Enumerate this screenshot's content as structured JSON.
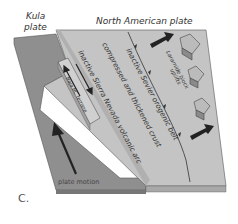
{
  "diagram": {
    "panel_label": "C.",
    "kula_plate_label_line1": "Kula",
    "kula_plate_label_line2": "plate",
    "north_american_plate_label": "North American plate",
    "baja_terrane_label": "Baja BC terrane",
    "sierra_arc_label": "inactive Sierra Nevada volcanic arc",
    "crust_label": "compressed and thickened crust",
    "sevier_label": "inactive Sevier orogenic belt",
    "laramide_label_line1": "Laramide block",
    "laramide_label_line2": "uplifts",
    "plate_motion_label": "plate motion",
    "colors": {
      "kula_plate": "#8f8f8f",
      "north_american_plate": "#c4c4c4",
      "plate_edge": "#a8a8a8",
      "arrow": "#222222",
      "block": "#9a9a9a"
    }
  }
}
